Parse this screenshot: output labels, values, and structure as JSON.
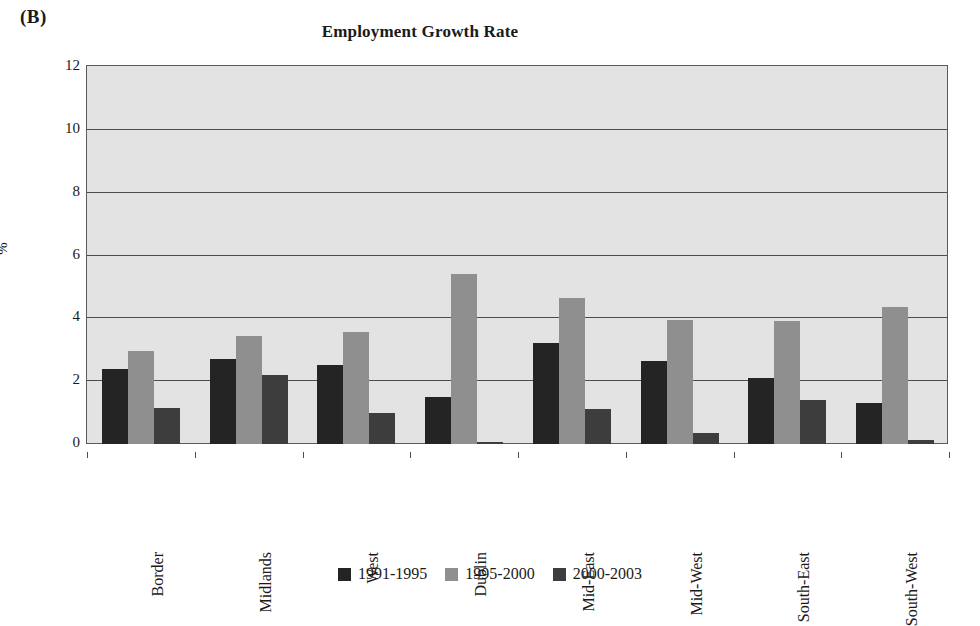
{
  "panel": {
    "label": "(B)"
  },
  "chart_data": {
    "type": "bar",
    "title": "Employment Growth Rate",
    "xlabel": "",
    "ylabel": "%",
    "ylim": [
      0,
      12
    ],
    "yticks": [
      0,
      2,
      4,
      6,
      8,
      10,
      12
    ],
    "grid": true,
    "legend_position": "bottom",
    "categories": [
      "Border",
      "Midlands",
      "West",
      "Dublin",
      "Mid-East",
      "Mid-West",
      "South-East",
      "South-West"
    ],
    "series": [
      {
        "name": "1991-1995",
        "color": "#242424",
        "values": [
          2.4,
          2.7,
          2.5,
          1.5,
          3.2,
          2.65,
          2.1,
          1.3
        ]
      },
      {
        "name": "1995-2000",
        "color": "#8f8f8f",
        "values": [
          2.95,
          3.45,
          3.55,
          5.4,
          4.65,
          3.95,
          3.9,
          4.35
        ]
      },
      {
        "name": "2000-2003",
        "color": "#3d3d3d",
        "values": [
          1.15,
          2.2,
          1.0,
          0.07,
          1.1,
          0.35,
          1.4,
          0.12
        ]
      }
    ]
  }
}
